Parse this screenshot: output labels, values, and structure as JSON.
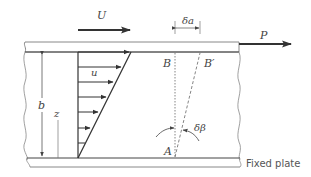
{
  "diagram": {
    "labels": {
      "velocity_U": "U",
      "force_P": "P",
      "displacement": "δa",
      "local_velocity": "u",
      "gap_height": "b",
      "height_coord": "z",
      "point_B": "B",
      "point_B_prime": "B′",
      "point_A": "A",
      "angle": "δβ",
      "fixed_plate": "Fixed plate"
    },
    "colors": {
      "line": "#333333",
      "plate_edge": "#888888",
      "text": "#444444",
      "dashed": "#666666"
    },
    "profile": {
      "arrow_count": 7,
      "shape": "linear"
    }
  }
}
